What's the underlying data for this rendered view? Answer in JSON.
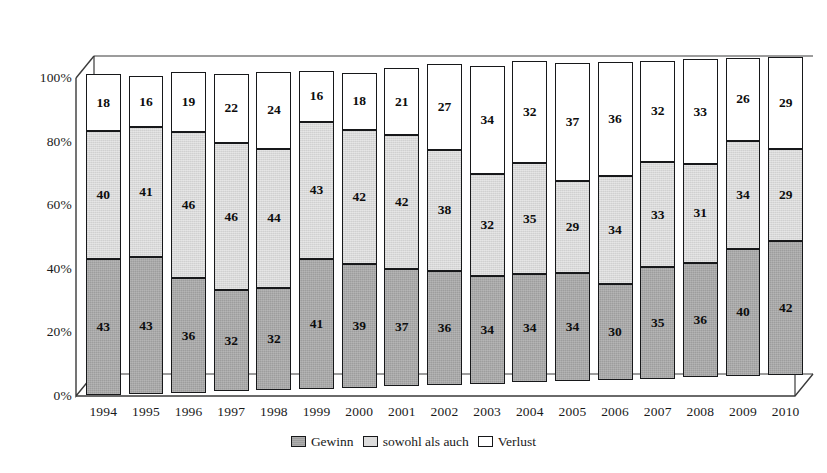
{
  "chart_data": {
    "type": "bar",
    "stacked": true,
    "normalized_percent": true,
    "title": "",
    "subtitle": "",
    "xlabel": "",
    "ylabel": "",
    "ylim": [
      0,
      100
    ],
    "grid": false,
    "legend_position": "bottom-center",
    "categories": [
      "1994",
      "1995",
      "1996",
      "1997",
      "1998",
      "1999",
      "2000",
      "2001",
      "2002",
      "2003",
      "2004",
      "2005",
      "2006",
      "2007",
      "2008",
      "2009",
      "2010"
    ],
    "y_ticks": [
      "0%",
      "20%",
      "40%",
      "60%",
      "80%",
      "100%"
    ],
    "y_tick_values": [
      0,
      20,
      40,
      60,
      80,
      100
    ],
    "series": [
      {
        "name": "Gewinn",
        "color": "#9d9d9d",
        "values": [
          43,
          43,
          36,
          32,
          32,
          41,
          39,
          37,
          36,
          34,
          34,
          34,
          30,
          35,
          36,
          40,
          42
        ]
      },
      {
        "name": "sowohl als auch",
        "color": "#d9d9d9",
        "values": [
          40,
          41,
          46,
          46,
          44,
          43,
          42,
          42,
          38,
          32,
          35,
          29,
          34,
          33,
          31,
          34,
          29
        ]
      },
      {
        "name": "Verlust",
        "color": "#ffffff",
        "values": [
          18,
          16,
          19,
          22,
          24,
          16,
          18,
          21,
          27,
          34,
          32,
          37,
          36,
          32,
          33,
          26,
          29
        ]
      }
    ]
  },
  "legend": {
    "items": [
      {
        "label": "Gewinn",
        "swatch": "swatch-dark-gray"
      },
      {
        "label": "sowohl als auch",
        "swatch": "swatch-light-gray"
      },
      {
        "label": "Verlust",
        "swatch": "swatch-white"
      }
    ]
  },
  "colors": {
    "gewinn": "#9d9d9d",
    "sowohl_als_auch": "#d9d9d9",
    "verlust": "#ffffff",
    "outline": "#17181a",
    "text": "#1a1a1a"
  }
}
